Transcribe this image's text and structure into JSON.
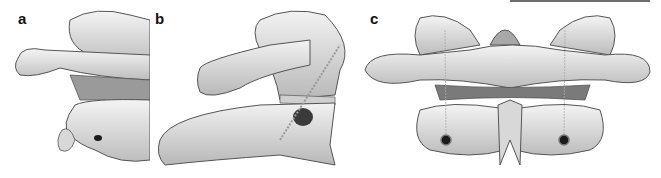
{
  "figure": {
    "panels": [
      {
        "label": "a",
        "view": "lateral-oblique (cropped)"
      },
      {
        "label": "b",
        "view": "lateral"
      },
      {
        "label": "c",
        "view": "posterior"
      }
    ],
    "colors": {
      "bone_light": "#efefef",
      "bone_mid": "#cfcfcf",
      "bone_shadow": "#8f8f8f",
      "outline": "#555555",
      "hole": "#1a1a1a",
      "top_rule": "#6e6e6e"
    }
  }
}
